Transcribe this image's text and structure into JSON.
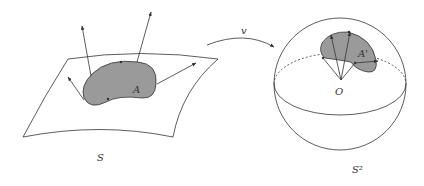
{
  "figure": {
    "labels": {
      "region_A": "A",
      "surface_S": "S",
      "map_v": "v",
      "region_A_prime": "A'",
      "origin_O": "O",
      "sphere_S2": "S²"
    },
    "colors": {
      "region_fill": "#9a9a9a",
      "stroke": "#333333"
    }
  }
}
